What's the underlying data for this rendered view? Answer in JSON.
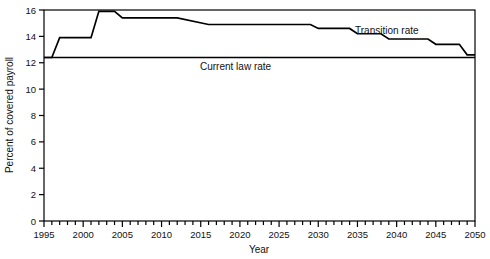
{
  "chart_data": {
    "type": "line",
    "title": "",
    "xlabel": "Year",
    "ylabel": "Percent of covered payroll",
    "xlim": [
      1995,
      2050
    ],
    "ylim": [
      0,
      16
    ],
    "ytick_values": [
      0,
      2,
      4,
      6,
      8,
      10,
      12,
      14,
      16
    ],
    "xtick_values": [
      1995,
      2000,
      2005,
      2010,
      2015,
      2020,
      2025,
      2030,
      2035,
      2040,
      2045,
      2050
    ],
    "xtick_labels": [
      "1995",
      "2000",
      "2005",
      "2010",
      "2015",
      "2020",
      "2025",
      "2030",
      "2035",
      "2040",
      "2045",
      "2050"
    ],
    "ytick_labels": [
      "0",
      "2",
      "4",
      "6",
      "8",
      "10",
      "12",
      "14",
      "16"
    ],
    "minor_xtick_interval": 1,
    "grid": false,
    "legend_position": "inline-annotation",
    "series": [
      {
        "name": "Current law rate",
        "style": "step",
        "annotation": "Current law rate",
        "x": [
          1995,
          2050
        ],
        "values": [
          12.4,
          12.4
        ]
      },
      {
        "name": "Transition rate",
        "style": "step",
        "annotation": "Transition rate",
        "x": [
          1995,
          1996,
          1997,
          1998,
          2001,
          2002,
          2003,
          2004,
          2005,
          2006,
          2011,
          2012,
          2016,
          2017,
          2029,
          2030,
          2034,
          2035,
          2038,
          2039,
          2044,
          2045,
          2048,
          2049,
          2050
        ],
        "values": [
          12.4,
          12.4,
          13.9,
          13.9,
          13.9,
          15.9,
          15.9,
          15.9,
          15.4,
          15.4,
          15.4,
          15.4,
          14.9,
          14.9,
          14.9,
          14.6,
          14.6,
          14.2,
          14.2,
          13.8,
          13.8,
          13.4,
          13.4,
          12.6,
          12.6
        ]
      }
    ]
  },
  "axes": {
    "x_title": "Year",
    "y_title": "Percent of covered payroll"
  },
  "annotations": {
    "current_law": "Current law rate",
    "transition": "Transition rate"
  }
}
